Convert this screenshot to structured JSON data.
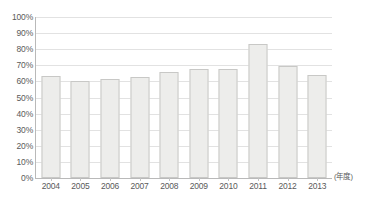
{
  "chart_data": {
    "type": "bar",
    "title": "",
    "subtitle": "",
    "xlabel": "(年度)",
    "ylabel": "",
    "categories": [
      "2004",
      "2005",
      "2006",
      "2007",
      "2008",
      "2009",
      "2010",
      "2011",
      "2012",
      "2013"
    ],
    "values": [
      63.5,
      60.5,
      61.8,
      62.5,
      66.0,
      68.0,
      67.5,
      83.0,
      69.8,
      63.8
    ],
    "series": [
      {
        "name": "",
        "values": [
          63.5,
          60.5,
          61.8,
          62.5,
          66.0,
          68.0,
          67.5,
          83.0,
          69.8,
          63.8
        ]
      }
    ],
    "ylim": [
      0,
      100
    ],
    "ytick_step": 10,
    "ytick_labels": [
      "100%",
      "90%",
      "80%",
      "70%",
      "60%",
      "50%",
      "40%",
      "30%",
      "20%",
      "10%",
      "0%"
    ],
    "ytick_values": [
      100,
      90,
      80,
      70,
      60,
      50,
      40,
      30,
      20,
      10,
      0
    ],
    "grid": true,
    "grid_axis": "y",
    "legend": false,
    "legend_position": "none",
    "value_unit": "%",
    "colors": {
      "bar_fill": "#ededeb",
      "bar_border": "#c8c8c6",
      "gridline": "#e2e2e2",
      "axis": "#b9b9b9",
      "text": "#5a5a5a",
      "background": "#ffffff"
    }
  },
  "axis_note": {
    "text": "(年度)"
  }
}
